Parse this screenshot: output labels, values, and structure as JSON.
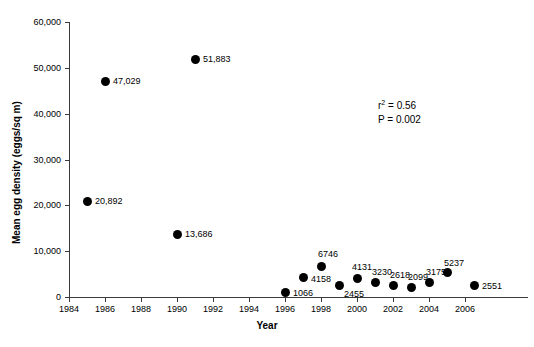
{
  "chart_data": {
    "type": "scatter",
    "title": "",
    "xlabel": "Year",
    "ylabel": "Mean egg density (eggs/sq m)",
    "xlim": [
      1984,
      2006.8
    ],
    "ylim": [
      0,
      60000
    ],
    "x_tick_labels": [
      "1984",
      "1986",
      "1988",
      "1990",
      "1992",
      "1994",
      "1996",
      "1998",
      "2000",
      "2002",
      "2004",
      "2006"
    ],
    "x_ticks": [
      1984,
      1986,
      1988,
      1990,
      1992,
      1994,
      1996,
      1998,
      2000,
      2002,
      2004,
      2006
    ],
    "y_tick_labels": [
      "0",
      "10,000",
      "20,000",
      "30,000",
      "40,000",
      "50,000",
      "60,000"
    ],
    "y_ticks": [
      0,
      10000,
      20000,
      30000,
      40000,
      50000,
      60000
    ],
    "grid": false,
    "legend": false,
    "marker_color": "#000000",
    "points": [
      {
        "x": 1985,
        "y": 20892,
        "label": "20,892",
        "label_dx": 8,
        "label_dy": -5
      },
      {
        "x": 1986,
        "y": 47029,
        "label": "47,029",
        "label_dx": 8,
        "label_dy": -5
      },
      {
        "x": 1990,
        "y": 13686,
        "label": "13,686",
        "label_dx": 8,
        "label_dy": -5
      },
      {
        "x": 1991,
        "y": 51883,
        "label": "51,883",
        "label_dx": 8,
        "label_dy": -5
      },
      {
        "x": 1996,
        "y": 1066,
        "label": "1066",
        "label_dx": 8,
        "label_dy": -4
      },
      {
        "x": 1997,
        "y": 4158,
        "label": "4158",
        "label_dx": 8,
        "label_dy": -4
      },
      {
        "x": 1998,
        "y": 6746,
        "label": "6746",
        "label_dx": -3,
        "label_dy": -17
      },
      {
        "x": 1999,
        "y": 2455,
        "label": "2455",
        "label_dx": 5,
        "label_dy": 3
      },
      {
        "x": 2000,
        "y": 4131,
        "label": "4131",
        "label_dx": -5,
        "label_dy": -16
      },
      {
        "x": 2001,
        "y": 3230,
        "label": "3230",
        "label_dx": -3,
        "label_dy": -15
      },
      {
        "x": 2002,
        "y": 2618,
        "label": "2618",
        "label_dx": -3,
        "label_dy": -15
      },
      {
        "x": 2003,
        "y": 2099,
        "label": "2099",
        "label_dx": -3,
        "label_dy": -15
      },
      {
        "x": 2004,
        "y": 3175,
        "label": "3175",
        "label_dx": -3,
        "label_dy": -15
      },
      {
        "x": 2005,
        "y": 5237,
        "label": "5237",
        "label_dx": -3,
        "label_dy": -15
      },
      {
        "x": 2006.5,
        "y": 2551,
        "label": "2551",
        "label_dx": 8,
        "label_dy": -4
      }
    ],
    "annotations": {
      "r_squared_label": "r",
      "r_squared_exponent": "2",
      "r_squared_value": " = 0.56",
      "p_value_text": "P = 0.002"
    }
  }
}
